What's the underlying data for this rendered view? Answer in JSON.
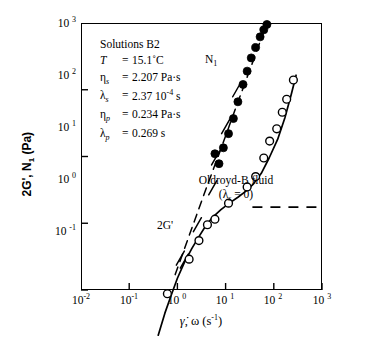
{
  "chart_data": {
    "type": "scatter",
    "title": "",
    "xlabel": "γ̇, ω (s⁻¹)",
    "ylabel": "2G', N₁ (Pa)",
    "xscale": "log",
    "yscale": "log",
    "xlim": [
      0.01,
      1000
    ],
    "ylim": [
      0.1,
      1000
    ],
    "grid": false,
    "legend": "none",
    "xticks": [
      "10⁻²",
      "10⁻¹",
      "10⁰",
      "10¹",
      "10²",
      "10³"
    ],
    "xtick_values": [
      0.01,
      0.1,
      1,
      10,
      100,
      1000
    ],
    "yticks": [
      "10⁻¹",
      "10⁰",
      "10¹",
      "10²",
      "10³"
    ],
    "ytick_values": [
      0.1,
      1,
      10,
      100,
      1000
    ],
    "series": [
      {
        "name": "N1",
        "marker": "filled-circle",
        "points": [
          [
            6.0,
            11.0
          ],
          [
            7.3,
            7.8
          ],
          [
            9.0,
            13.5
          ],
          [
            11.5,
            22.0
          ],
          [
            14.5,
            37.0
          ],
          [
            18.0,
            66.0
          ],
          [
            23.0,
            120.0
          ],
          [
            28.0,
            190.0
          ],
          [
            34.0,
            300.0
          ],
          [
            42.0,
            430.0
          ],
          [
            52.0,
            620.0
          ],
          [
            62.0,
            790.0
          ],
          [
            72.0,
            950.0
          ]
        ]
      },
      {
        "name": "2G'",
        "marker": "open-circle",
        "points": [
          [
            0.62,
            0.088
          ],
          [
            1.75,
            0.29
          ],
          [
            2.8,
            0.55
          ],
          [
            4.2,
            0.95
          ],
          [
            6.0,
            1.15
          ],
          [
            11.5,
            2.0
          ],
          [
            28.0,
            3.5
          ],
          [
            42.0,
            5.0
          ],
          [
            62.0,
            9.5
          ],
          [
            82.0,
            17.0
          ],
          [
            115.0,
            26.0
          ],
          [
            150.0,
            46.0
          ],
          [
            185.0,
            72.0
          ],
          [
            255.0,
            140.0
          ]
        ]
      }
    ],
    "curves": [
      {
        "name": "2G'-model-fit",
        "style": "solid",
        "points": [
          [
            0.4,
            0.021
          ],
          [
            0.55,
            0.045
          ],
          [
            0.75,
            0.085
          ],
          [
            1.0,
            0.15
          ],
          [
            1.4,
            0.26
          ],
          [
            2.0,
            0.42
          ],
          [
            2.8,
            0.63
          ],
          [
            4.0,
            0.95
          ],
          [
            5.5,
            1.25
          ],
          [
            8.0,
            1.6
          ],
          [
            12.0,
            2.0
          ],
          [
            18.0,
            2.45
          ],
          [
            26.0,
            3.0
          ],
          [
            38.0,
            3.9
          ],
          [
            55.0,
            5.6
          ],
          [
            80.0,
            9.5
          ],
          [
            120.0,
            18.0
          ],
          [
            170.0,
            38.0
          ],
          [
            230.0,
            85.0
          ],
          [
            290.0,
            165.0
          ]
        ]
      },
      {
        "name": "N1-model-fit",
        "style": "dashed",
        "points": [
          [
            0.9,
            0.17
          ],
          [
            2.0,
            0.85
          ],
          [
            4.0,
            3.4
          ],
          [
            8.0,
            13.0
          ],
          [
            16.0,
            52.0
          ],
          [
            32.0,
            200.0
          ],
          [
            60.0,
            700.0
          ],
          [
            75.0,
            1050.0
          ]
        ]
      },
      {
        "name": "oldroyd-b-asymptote",
        "style": "dashed-horizontal",
        "y": 1.75,
        "x_from": 36.0,
        "x_to": 1000.0
      }
    ],
    "slope_marks": [
      {
        "label": "slope-2-lower",
        "x": 1.15,
        "y": 0.3
      },
      {
        "label": "slope-2-mid",
        "x": 2.6,
        "y": 0.95
      },
      {
        "label": "slope-2-upper",
        "x": 5.4,
        "y": 3.4
      },
      {
        "label": "slope-2-n1-lower",
        "x": 6.2,
        "y": 9.5
      },
      {
        "label": "slope-2-n1-mid",
        "x": 10.0,
        "y": 28.0
      },
      {
        "label": "slope-2-n1-upper",
        "x": 17.0,
        "y": 100.0
      }
    ]
  },
  "params": {
    "solution_title": "Solutions B2",
    "rows": [
      {
        "symbol": "T",
        "symbol_sub": "",
        "eq": "=",
        "value": "15.1˚C"
      },
      {
        "symbol": "η",
        "symbol_sub": "s",
        "eq": "=",
        "value": "2.207 Pa·s"
      },
      {
        "symbol": "λ",
        "symbol_sub": "s",
        "eq": "=",
        "value": "2.37 10",
        "value_sup": "-4",
        "value_tail": " s"
      },
      {
        "symbol": "η",
        "symbol_sub": "p",
        "eq": "=",
        "value": "0.234 Pa·s"
      },
      {
        "symbol": "λ",
        "symbol_sub": "p",
        "eq": "=",
        "value": "0.269 s"
      }
    ]
  },
  "annotations": {
    "n1_label": "N",
    "n1_label_sub": "1",
    "twog_label": "2G'",
    "oldroyd_line1": "Oldroyd-B fluid",
    "oldroyd_line2_pre": "(",
    "oldroyd_line2_sym": "λ",
    "oldroyd_line2_sub": "s",
    "oldroyd_line2_post": " = 0)"
  },
  "axes": {
    "x_title_sym1": "γ̇",
    "x_title_rest": ", ω  (s",
    "x_title_sup": "-1",
    "x_title_close": ")",
    "y_title": "2G', N",
    "y_title_sub": "1",
    "y_title_unit": " (Pa)"
  },
  "colors": {
    "background": "#ffffff",
    "foreground": "#000000",
    "marker_fill": "#000000",
    "marker_open": "#ffffff"
  }
}
